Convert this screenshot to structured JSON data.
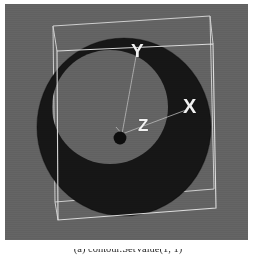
{
  "figure": {
    "caption": "(a)  contour.SetValue(1, 1)",
    "caption_prefix": "(a)",
    "caption_code": "contour.SetValue(1, 1)"
  },
  "render_view": {
    "name": "vtk-render-window",
    "background_color": "#636363",
    "width": 243,
    "height": 236
  },
  "axes": {
    "origin_marker": "origin-dot",
    "labels": [
      {
        "id": "x",
        "text": "X",
        "color": "#f2f2f2"
      },
      {
        "id": "y",
        "text": "Y",
        "color": "#f2f2f2"
      },
      {
        "id": "z",
        "text": "Z",
        "color": "#f2f2f2"
      }
    ]
  },
  "outline_box": {
    "name": "bounding-box-outline",
    "color": "#d8d8d8",
    "line_width": 1
  },
  "isosurface": {
    "name": "contour-isosurface",
    "shape": "torus-annulus",
    "fill_color": "#141414",
    "inner_fill_color": "#6e6e6e",
    "description": "dark annular isosurface of a quadric contour"
  },
  "colors": {
    "viewport_background": "#636363",
    "surface_dark": "#141414",
    "surface_inner": "#6e6e6e",
    "wireframe": "#d8d8d8",
    "label_text": "#f2f2f2",
    "page_background": "#ffffff",
    "caption_text": "#2a2a2a"
  }
}
